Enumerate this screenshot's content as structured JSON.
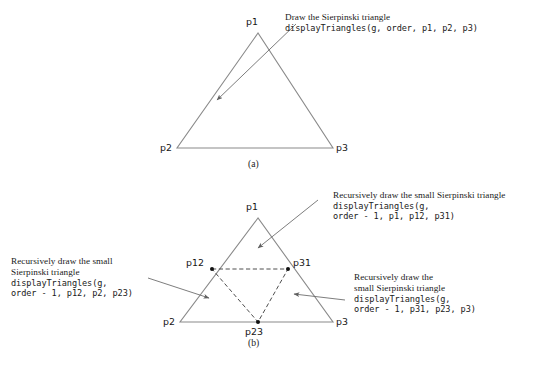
{
  "figure": {
    "colors": {
      "solid_line": "#8a8a8a",
      "dashed_line": "#3a3a3a",
      "arrow_line": "#6e6e6e",
      "vertex_dot": "#111111",
      "text": "#1a1a1a",
      "background": "#ffffff"
    },
    "part_a": {
      "caption": "(a)",
      "vertex_labels": {
        "p1": "p1",
        "p2": "p2",
        "p3": "p3"
      },
      "annotation": {
        "prose": "Draw the Sierpinski triangle",
        "code": "displayTriangles(g, order, p1, p2, p3)"
      }
    },
    "part_b": {
      "caption": "(b)",
      "vertex_labels": {
        "p1": "p1",
        "p2": "p2",
        "p3": "p3",
        "p12": "p12",
        "p23": "p23",
        "p31": "p31"
      },
      "annotation_top": {
        "prose_line1": "Recursively draw the small Sierpinski triangle",
        "code_line1": "displayTriangles(g,",
        "code_line2": "order - 1, p1, p12, p31)"
      },
      "annotation_left": {
        "prose_line1": "Recursively draw the small",
        "prose_line2": "Sierpinski triangle",
        "code_line1": "displayTriangles(g,",
        "code_line2": "order - 1, p12, p2, p23)"
      },
      "annotation_right": {
        "prose_line1": "Recursively draw the",
        "prose_line2": "small Sierpinski triangle",
        "code_line1": "displayTriangles(g,",
        "code_line2": "order - 1, p31, p23, p3)"
      }
    }
  }
}
